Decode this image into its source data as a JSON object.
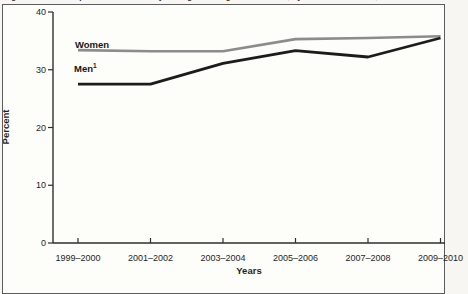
{
  "caption": {
    "text": "Figure 4. Trends in prevalence of obesity among adults aged 20 and over, by sex: United States, 1999–2010"
  },
  "chart_data": {
    "type": "line",
    "categories": [
      "1999–2000",
      "2001–2002",
      "2003–2004",
      "2005–2006",
      "2007–2008",
      "2009–2010"
    ],
    "series": [
      {
        "name": "Women",
        "values": [
          33.4,
          33.2,
          33.2,
          35.3,
          35.5,
          35.8
        ],
        "color": "#8c8c8c"
      },
      {
        "name": "Men",
        "footnote_marker": "1",
        "values": [
          27.5,
          27.5,
          31.1,
          33.3,
          32.2,
          35.5
        ],
        "color": "#1c1c1c"
      }
    ],
    "xlabel": "Years",
    "ylabel": "Percent",
    "ylim": [
      0,
      40
    ],
    "yticks": [
      0,
      10,
      20,
      30,
      40
    ],
    "grid": false,
    "legend_position": "inline-labels-above-lines"
  },
  "colors": {
    "axis": "#2e2e2e",
    "frame_border": "#5c5c5c",
    "background": "#fdfdfa"
  }
}
